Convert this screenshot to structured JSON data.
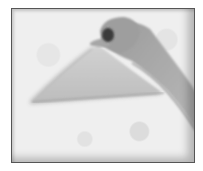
{
  "image": {
    "description": "Grayscale photograph of a hand lifting a sheet of paper into a triangular fold on a textured surface",
    "colors": {
      "background": "#efefef",
      "border": "#555555",
      "paper": "#c9c9c9",
      "paper_shadow": "#8a8a8a",
      "skin": "#a8a8a8",
      "skin_dark": "#6a6a6a"
    }
  }
}
